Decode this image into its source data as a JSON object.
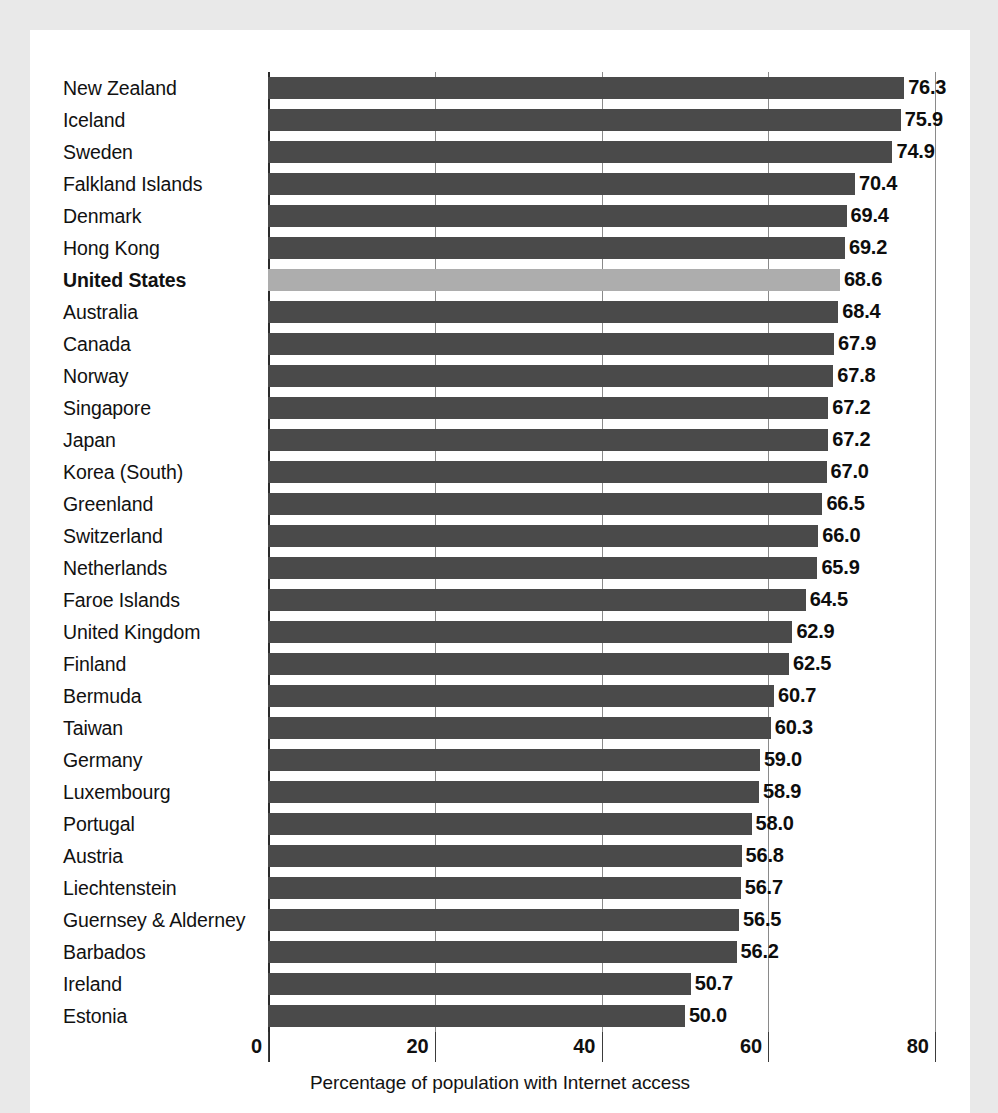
{
  "chart_data": {
    "type": "bar",
    "orientation": "horizontal",
    "title": "",
    "xlabel": "Percentage of population with Internet access",
    "ylabel": "",
    "xlim": [
      0,
      80
    ],
    "xticks": [
      0,
      20,
      40,
      60,
      80
    ],
    "xtick_labels": [
      "0",
      "20",
      "40",
      "60",
      "80"
    ],
    "grid": true,
    "grid_axis": "x",
    "legend": false,
    "bar_color": "#4a4a4a",
    "highlight_color": "#adadad",
    "highlight_category": "United States",
    "categories": [
      "New Zealand",
      "Iceland",
      "Sweden",
      "Falkland Islands",
      "Denmark",
      "Hong Kong",
      "United States",
      "Australia",
      "Canada",
      "Norway",
      "Singapore",
      "Japan",
      "Korea (South)",
      "Greenland",
      "Switzerland",
      "Netherlands",
      "Faroe Islands",
      "United Kingdom",
      "Finland",
      "Bermuda",
      "Taiwan",
      "Germany",
      "Luxembourg",
      "Portugal",
      "Austria",
      "Liechtenstein",
      "Guernsey & Alderney",
      "Barbados",
      "Ireland",
      "Estonia"
    ],
    "values": [
      76.3,
      75.9,
      74.9,
      70.4,
      69.4,
      69.2,
      68.6,
      68.4,
      67.9,
      67.8,
      67.2,
      67.2,
      67.0,
      66.5,
      66.0,
      65.9,
      64.5,
      62.9,
      62.5,
      60.7,
      60.3,
      59.0,
      58.9,
      58.0,
      56.8,
      56.7,
      56.5,
      56.2,
      50.7,
      50.0
    ],
    "value_labels": [
      "76.3",
      "75.9",
      "74.9",
      "70.4",
      "69.4",
      "69.2",
      "68.6",
      "68.4",
      "67.9",
      "67.8",
      "67.2",
      "67.2",
      "67.0",
      "66.5",
      "66.0",
      "65.9",
      "64.5",
      "62.9",
      "62.5",
      "60.7",
      "60.3",
      "59.0",
      "58.9",
      "58.0",
      "56.8",
      "56.7",
      "56.5",
      "56.2",
      "50.7",
      "50.0"
    ]
  }
}
